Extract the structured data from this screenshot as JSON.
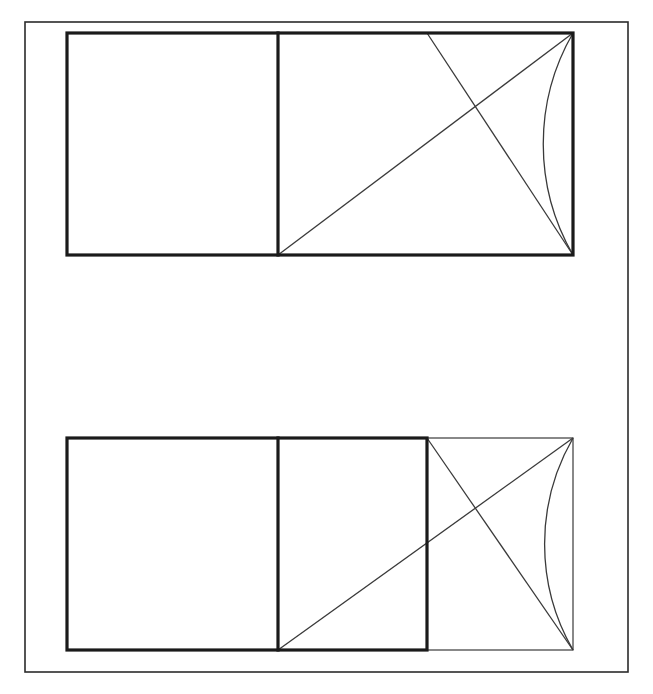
{
  "page": {
    "width": 653,
    "height": 694,
    "background_color": "#ffffff",
    "ink_color": "#2b2b2b"
  },
  "frame": {
    "label": "outer page border",
    "x": 25,
    "y": 22,
    "width": 603,
    "height": 650,
    "stroke_color": "#2b2b2b",
    "stroke_width": 1.6
  },
  "figures": [
    {
      "id": "upper-figure",
      "label": "Upper rectangle construction",
      "outer_rect": {
        "x": 67,
        "y": 33,
        "width": 506,
        "height": 222
      },
      "bold_rect": {
        "x": 67,
        "y": 33,
        "width": 506,
        "height": 222
      },
      "divider_x": 278,
      "divider_label": "vertical divider separating left square from right rectangle",
      "left_square": {
        "x": 67,
        "y": 33,
        "width": 211,
        "height": 222
      },
      "right_rect": {
        "x": 278,
        "y": 33,
        "width": 295,
        "height": 222
      },
      "rising_diagonal": {
        "x1": 278,
        "y1": 255,
        "x2": 573,
        "y2": 33
      },
      "falling_diagonal": {
        "x1": 427,
        "y1": 33,
        "x2": 573,
        "y2": 255
      },
      "arc": {
        "start_x": 573,
        "start_y": 33,
        "end_x": 573,
        "end_y": 255,
        "radius": 222,
        "sweep": 0,
        "large_arc": 0,
        "description": "quarter arc from top-right corner to bottom-right corner bulging left"
      },
      "intersection_point": {
        "x": 470,
        "y": 110
      }
    },
    {
      "id": "lower-figure",
      "label": "Lower rectangle construction",
      "outer_rect": {
        "x": 67,
        "y": 438,
        "width": 506,
        "height": 212
      },
      "bold_rect": {
        "x": 67,
        "y": 438,
        "width": 360,
        "height": 212
      },
      "thin_rect": {
        "x": 427,
        "y": 438,
        "width": 146,
        "height": 212
      },
      "divider_x": 278,
      "divider_label": "vertical divider separating left square from middle rectangle",
      "left_square": {
        "x": 67,
        "y": 438,
        "width": 211,
        "height": 212
      },
      "middle_rect": {
        "x": 278,
        "y": 438,
        "width": 149,
        "height": 212
      },
      "right_square": {
        "x": 427,
        "y": 438,
        "width": 146,
        "height": 212
      },
      "rising_diagonal": {
        "x1": 278,
        "y1": 650,
        "x2": 573,
        "y2": 438
      },
      "falling_diagonal": {
        "x1": 427,
        "y1": 438,
        "x2": 573,
        "y2": 650
      },
      "arc": {
        "start_x": 573,
        "start_y": 438,
        "end_x": 573,
        "end_y": 650,
        "radius": 212,
        "sweep": 0,
        "large_arc": 0,
        "description": "quarter arc from top-right corner to bottom-right corner bulging left"
      },
      "intersection_point": {
        "x": 497,
        "y": 517
      }
    }
  ],
  "styles": {
    "bold_stroke_width": 3.2,
    "thin_stroke_width": 1.2,
    "construction_stroke_width": 1.3,
    "bold_stroke_color": "#1a1a1a",
    "thin_stroke_color": "#3a3a3a"
  }
}
